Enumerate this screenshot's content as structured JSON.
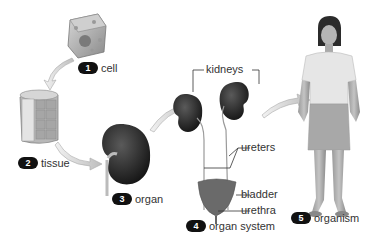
{
  "diagram": {
    "steps": [
      {
        "number": "1",
        "label": "cell"
      },
      {
        "number": "2",
        "label": "tissue"
      },
      {
        "number": "3",
        "label": "organ"
      },
      {
        "number": "4",
        "label": "organ system"
      },
      {
        "number": "5",
        "label": "organism"
      }
    ],
    "organ_system_parts": {
      "kidneys": "kidneys",
      "ureters": "ureters",
      "bladder": "bladder",
      "urethra": "urethra"
    },
    "colors": {
      "badge": "#111111",
      "arrow": "#c8c8c8",
      "kidney": "#2a2a2a",
      "text": "#333333"
    }
  }
}
